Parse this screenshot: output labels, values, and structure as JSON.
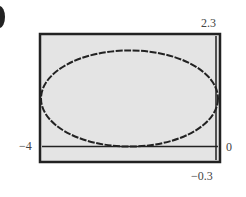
{
  "chart_data": {
    "type": "line",
    "title": "",
    "xlabel": "",
    "ylabel": "",
    "xlim": [
      -4,
      0
    ],
    "ylim": [
      -0.3,
      2.3
    ],
    "grid": false,
    "legend": null,
    "tick_labels": {
      "xmin": "−4",
      "xmax": "0",
      "ymax": "2.3",
      "ymin": "−0.3"
    },
    "series": [
      {
        "name": "ellipse",
        "shape": "ellipse",
        "center": [
          -2,
          1
        ],
        "semi_axis_x": 2,
        "semi_axis_y": 1,
        "color": "#222222"
      }
    ],
    "background_color": "#e4e4e4",
    "frame_color": "#222222"
  },
  "labels": {
    "xmin": "−4",
    "xmax": "0",
    "ymax": "2.3",
    "ymin": "−0.3"
  }
}
